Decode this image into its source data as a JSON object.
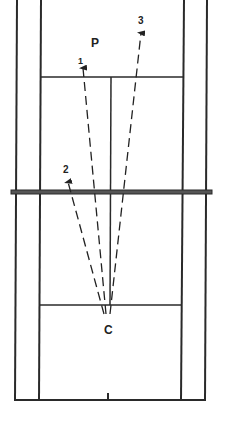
{
  "diagram": {
    "type": "court-shot-diagram",
    "labels": {
      "player": "P",
      "origin": "C",
      "shot1": "1",
      "shot2": "2",
      "shot3": "3"
    },
    "colors": {
      "line": "#2a2a2a",
      "net": "#3a3a3a",
      "background": "#ffffff"
    },
    "court": {
      "outer_left_x": 17,
      "inner_left_x": 41,
      "inner_right_x": 183,
      "outer_right_x": 207,
      "top_service_line_y": 77,
      "net_y": 192,
      "bottom_service_line_y": 305,
      "baseline_y": 400,
      "center_x": 111
    },
    "shots": [
      {
        "label": "1",
        "from": [
          106,
          314
        ],
        "to": [
          83,
          66
        ]
      },
      {
        "label": "2",
        "from": [
          104,
          314
        ],
        "to": [
          68,
          180
        ]
      },
      {
        "label": "3",
        "from": [
          110,
          314
        ],
        "to": [
          141,
          31
        ]
      }
    ]
  }
}
